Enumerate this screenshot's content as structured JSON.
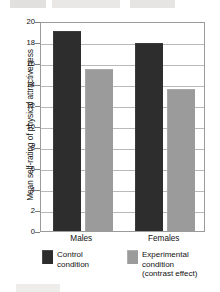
{
  "chart_data": {
    "type": "bar",
    "title": "",
    "subtitle": "",
    "xlabel": "",
    "ylabel": "Mean self-rating of physical attractiveness",
    "categories": [
      "Males",
      "Females"
    ],
    "series": [
      {
        "name": "Control condition",
        "color": "#2d2d2d",
        "values": [
          19.0,
          17.8
        ]
      },
      {
        "name": "Experimental condition (contrast effect)",
        "color": "#9b9b9b",
        "values": [
          15.3,
          13.4
        ]
      }
    ],
    "ylim": [
      0,
      20
    ],
    "yticks": [
      0,
      2,
      4,
      6,
      8,
      10,
      12,
      14,
      16,
      18,
      20
    ],
    "ytick_labels": [
      "0",
      "2",
      "4",
      "6",
      "8",
      "10",
      "12",
      "14",
      "16",
      "18",
      "20"
    ],
    "grid": true,
    "grid_axis": "y",
    "legend_position": "below"
  },
  "legend": {
    "entries": [
      {
        "swatch": "dark-swatch",
        "lines": [
          "Control",
          "condition"
        ]
      },
      {
        "swatch": "gray-swatch",
        "lines": [
          "Experimental",
          "condition",
          "(contrast effect)"
        ]
      }
    ]
  }
}
